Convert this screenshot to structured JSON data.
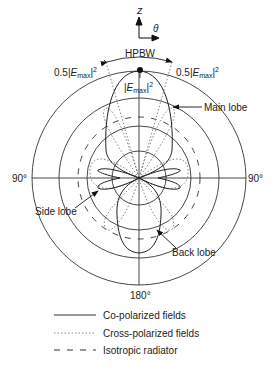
{
  "diagram": {
    "axis": {
      "z_label": "z",
      "theta_label": "θ"
    },
    "angle_labels": {
      "left": "90°",
      "right": "90°",
      "bottom": "180°"
    },
    "annotations": {
      "hpbw": "HPBW",
      "half_power_left_prefix": "0.5|",
      "half_power_right_prefix": "0.5|",
      "e_symbol": "E",
      "e_sub": "max",
      "e_suffix": "|",
      "exponent": "2",
      "peak_prefix": "|",
      "main_lobe": "Main lobe",
      "side_lobe": "Side lobe",
      "back_lobe": "Back lobe"
    },
    "legend": [
      {
        "label": "Co-polarized fields",
        "style": "solid"
      },
      {
        "label": "Cross-polarized fields",
        "style": "dotted"
      },
      {
        "label": "Isotropic radiator",
        "style": "dashed"
      }
    ],
    "colors": {
      "line": "#222222",
      "dotted": "#777777"
    }
  }
}
